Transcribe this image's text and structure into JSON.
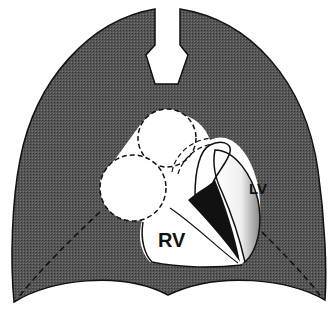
{
  "diagram": {
    "type": "anatomical-illustration",
    "labels": {
      "left_ventricle": "LV",
      "right_ventricle": "RV"
    },
    "colors": {
      "lung_fill": "#4a4a4a",
      "heart_fill": "#ffffff",
      "outline": "#111111",
      "background": "#ffffff"
    }
  }
}
